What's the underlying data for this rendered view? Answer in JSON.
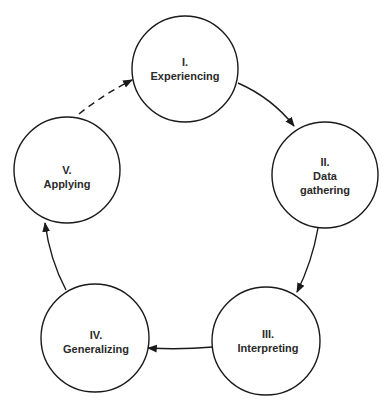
{
  "diagram": {
    "type": "cycle",
    "stroke_color": "#1a1a1a",
    "text_color": "#2a2a2a",
    "nodes": [
      {
        "id": "I",
        "number": "I.",
        "lines": [
          "Experiencing"
        ]
      },
      {
        "id": "II",
        "number": "II.",
        "lines": [
          "Data",
          "gathering"
        ]
      },
      {
        "id": "III",
        "number": "III.",
        "lines": [
          "Interpreting"
        ]
      },
      {
        "id": "IV",
        "number": "IV.",
        "lines": [
          "Generalizing"
        ]
      },
      {
        "id": "V",
        "number": "V.",
        "lines": [
          "Applying"
        ]
      }
    ],
    "edges": [
      {
        "from": "I",
        "to": "II",
        "style": "solid"
      },
      {
        "from": "II",
        "to": "III",
        "style": "solid"
      },
      {
        "from": "III",
        "to": "IV",
        "style": "solid"
      },
      {
        "from": "IV",
        "to": "V",
        "style": "solid"
      },
      {
        "from": "V",
        "to": "I",
        "style": "dashed"
      }
    ]
  }
}
